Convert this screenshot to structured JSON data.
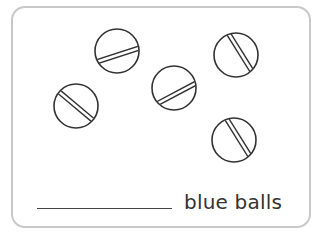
{
  "worksheet": {
    "prompt_suffix": "blue balls",
    "answer_blank": "",
    "colors": {
      "border": "#c8c8c8",
      "outline": "#333333",
      "text": "#333333"
    },
    "balls": [
      {
        "id": 1,
        "cx": 117,
        "cy": 51,
        "r": 22,
        "stripe_angle": -18
      },
      {
        "id": 2,
        "cx": 76,
        "cy": 106,
        "r": 22,
        "stripe_angle": 40
      },
      {
        "id": 3,
        "cx": 174,
        "cy": 88,
        "r": 22,
        "stripe_angle": -28
      },
      {
        "id": 4,
        "cx": 236,
        "cy": 55,
        "r": 22,
        "stripe_angle": 58
      },
      {
        "id": 5,
        "cx": 234,
        "cy": 140,
        "r": 22,
        "stripe_angle": 58
      }
    ]
  }
}
